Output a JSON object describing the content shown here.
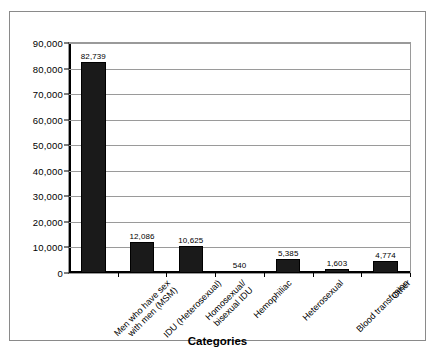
{
  "figure": {
    "frame_border_color": "#8a8a8a",
    "background_color": "#ffffff"
  },
  "chart_data": {
    "type": "bar",
    "title": "",
    "xlabel": "Categories",
    "ylabel": "",
    "ylim": [
      0,
      90000
    ],
    "ytick_labels": [
      "0",
      "10,000",
      "20,000",
      "30,000",
      "40,000",
      "50,000",
      "60,000",
      "70,000",
      "80,000",
      "90,000"
    ],
    "ytick_values": [
      0,
      10000,
      20000,
      30000,
      40000,
      50000,
      60000,
      70000,
      80000,
      90000
    ],
    "grid": true,
    "legend": "none",
    "bar_color": "#1a1a1a",
    "categories": [
      "Men who have sex\nwith men (MSM)",
      "IDU (Heterosexual)",
      "Homosexual/\nbisexual IDU",
      "Hemophiliac",
      "Heterosexual",
      "Blood transfusion",
      "Other"
    ],
    "values": [
      82739,
      12086,
      10625,
      540,
      5385,
      1603,
      4774
    ],
    "value_labels": [
      "82,739",
      "12,086",
      "10,625",
      "540",
      "5,385",
      "1,603",
      "4,774"
    ]
  },
  "caption": {
    "text": ""
  }
}
